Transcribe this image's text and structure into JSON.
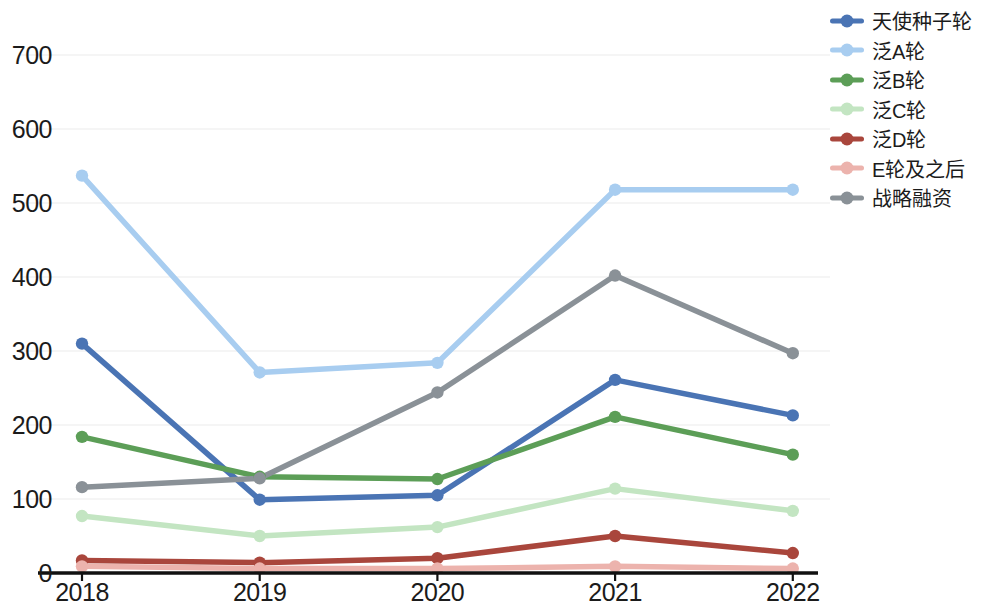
{
  "chart_data": {
    "type": "line",
    "title": "",
    "xlabel": "",
    "ylabel": "",
    "x": [
      "2018",
      "2019",
      "2020",
      "2021",
      "2022"
    ],
    "categories": [
      "2018",
      "2019",
      "2020",
      "2021",
      "2022"
    ],
    "ylim": [
      0,
      700
    ],
    "yticks": [
      0,
      100,
      200,
      300,
      400,
      500,
      600,
      700
    ],
    "ytick_labels": [
      "0",
      "100",
      "200",
      "300",
      "400",
      "500",
      "600",
      "700"
    ],
    "grid": true,
    "legend_position": "right",
    "series": [
      {
        "name": "天使种子轮",
        "color": "#4a74b4",
        "values": [
          310,
          99,
          105,
          261,
          213
        ]
      },
      {
        "name": "泛A轮",
        "color": "#a8cdf0",
        "values": [
          537,
          271,
          284,
          518,
          518
        ]
      },
      {
        "name": "泛B轮",
        "color": "#5c9e57",
        "values": [
          184,
          130,
          127,
          211,
          160
        ]
      },
      {
        "name": "泛C轮",
        "color": "#c3e5c2",
        "values": [
          77,
          50,
          62,
          114,
          84
        ]
      },
      {
        "name": "泛D轮",
        "color": "#a9463c",
        "values": [
          17,
          14,
          20,
          50,
          27
        ]
      },
      {
        "name": "E轮及之后",
        "color": "#ecb3ad",
        "values": [
          9,
          6,
          6,
          9,
          6
        ]
      },
      {
        "name": "战略融资",
        "color": "#8a9197",
        "values": [
          116,
          128,
          244,
          402,
          297
        ]
      }
    ]
  },
  "axis": {
    "axis_color": "#111111",
    "grid_color": "#f2f2f2",
    "tick_color": "#1b1b1b"
  }
}
